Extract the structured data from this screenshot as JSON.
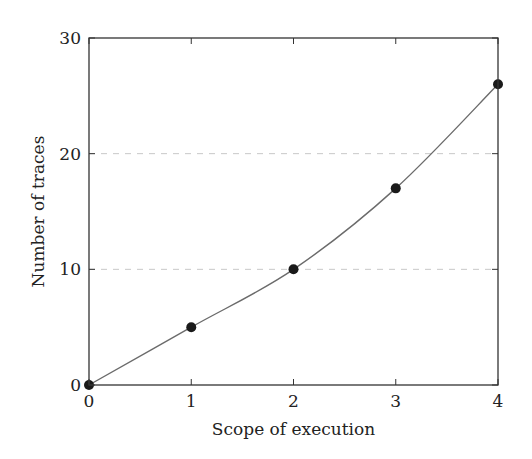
{
  "chart_data": {
    "type": "line",
    "title": "",
    "xlabel": "Scope of execution",
    "ylabel": "Number of traces",
    "x": [
      0,
      1,
      2,
      3,
      4
    ],
    "series": [
      {
        "name": "traces",
        "values": [
          0,
          5,
          10,
          17,
          26
        ],
        "marker": "circle",
        "color": "#1a1a1a",
        "line_color": "#6b6b6b",
        "smooth": true
      }
    ],
    "xlim": [
      0,
      4
    ],
    "ylim": [
      0,
      30
    ],
    "xticks": [
      0,
      1,
      2,
      3,
      4
    ],
    "yticks": [
      0,
      10,
      20,
      30
    ],
    "grid": {
      "y": true,
      "x": false,
      "style": "dashed",
      "color": "#c8c8c8",
      "lines_at": [
        10,
        20
      ]
    },
    "legend": null
  }
}
